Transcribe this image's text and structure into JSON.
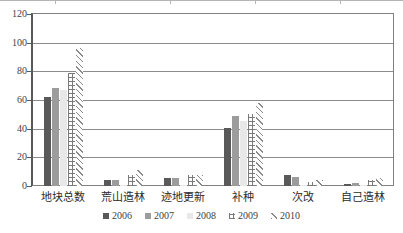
{
  "chart_data": {
    "type": "bar",
    "title": "",
    "xlabel": "",
    "ylabel": "",
    "ylim": [
      0,
      120
    ],
    "yticks": [
      0,
      20,
      40,
      60,
      80,
      100,
      120
    ],
    "grid": true,
    "legend_position": "bottom",
    "categories": [
      "地块总数",
      "荒山造林",
      "迹地更新",
      "补种",
      "次改",
      "自己造林"
    ],
    "series": [
      {
        "name": "2006",
        "color": "#595959",
        "pattern": "solid",
        "values": [
          62,
          4,
          5.5,
          40.5,
          8,
          1.5
        ]
      },
      {
        "name": "2007",
        "color": "#9c9c9c",
        "pattern": "solid",
        "values": [
          68.5,
          4,
          5.5,
          48.5,
          6.5,
          2
        ]
      },
      {
        "name": "2008",
        "color": "#e8e8e8",
        "pattern": "solid",
        "values": [
          67,
          1,
          1,
          45.5,
          0.5,
          0.5
        ]
      },
      {
        "name": "2009",
        "color": "#7a7a7a",
        "pattern": "grid",
        "values": [
          79,
          8,
          7.5,
          50,
          3,
          4.5
        ]
      },
      {
        "name": "2010",
        "color": "#8a8a8a",
        "pattern": "diagonal",
        "values": [
          96,
          11,
          8,
          58,
          4.5,
          5.5
        ]
      }
    ]
  },
  "legend": {
    "items": [
      {
        "label": "2006"
      },
      {
        "label": "2007"
      },
      {
        "label": "2008"
      },
      {
        "label": "2009"
      },
      {
        "label": "2010"
      }
    ]
  }
}
